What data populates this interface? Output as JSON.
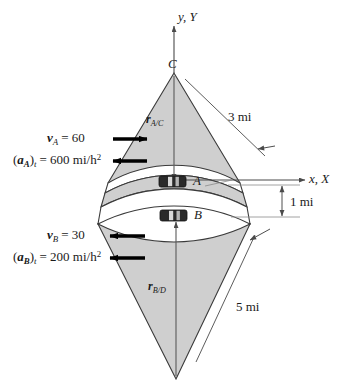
{
  "figure": {
    "axes": {
      "vertical_label": "y, Y",
      "horizontal_label": "x, X"
    },
    "points": {
      "center_top": "C",
      "car_a": "A",
      "car_b": "B"
    },
    "vectors": {
      "r_ac": "r",
      "r_ac_sub": "A/C",
      "r_bd": "r",
      "r_bd_sub": "B/D"
    },
    "dimensions": {
      "radius_a": "3 mi",
      "radius_b": "5 mi",
      "separation": "1 mi"
    },
    "car_a_kinematics": {
      "velocity_symbol": "v",
      "velocity_sub": "A",
      "velocity_value": "= 60",
      "accel_open": "(",
      "accel_symbol": "a",
      "accel_sub": "A",
      "accel_close": ")",
      "accel_sub_t": "t",
      "accel_value": "= 600 mi/h",
      "accel_exp": "2",
      "velocity_direction": "right",
      "accel_direction": "left"
    },
    "car_b_kinematics": {
      "velocity_symbol": "v",
      "velocity_sub": "B",
      "velocity_value": "= 30",
      "accel_open": "(",
      "accel_symbol": "a",
      "accel_sub": "B",
      "accel_close": ")",
      "accel_sub_t": "t",
      "accel_value": "= 200 mi/h",
      "accel_exp": "2",
      "velocity_direction": "left",
      "accel_direction": "left"
    },
    "colors": {
      "sector_fill": "#cfcfcf",
      "road_fill": "#ffffff",
      "outline": "#3a3a3a",
      "text": "#1a1a1a",
      "arrow": "#000000",
      "thin_line": "#6e6e6e"
    }
  }
}
